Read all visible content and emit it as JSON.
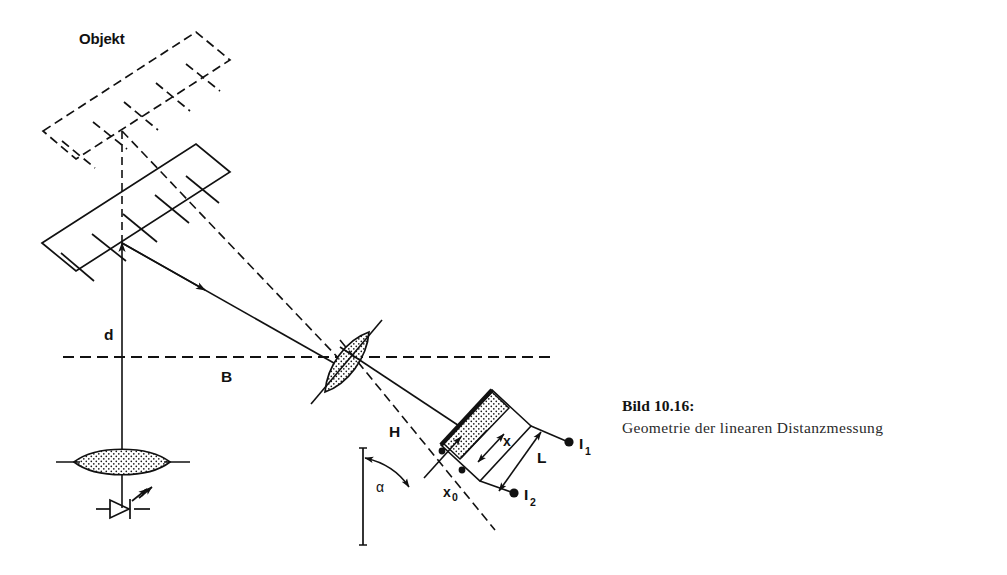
{
  "figure": {
    "caption_title": "Bild 10.16:",
    "caption_text": "Geometrie der linearen Distanzmessung",
    "background_color": "#ffffff",
    "ink_color": "#111111"
  },
  "labels": {
    "object": "Objekt",
    "distance_d": "d",
    "baseline_B": "B",
    "image_distance_H": "H",
    "angle_alpha": "α",
    "position_x": "x",
    "offset_x0_main": "x",
    "offset_x0_sub": "0",
    "detector_length_L": "L",
    "current_1_main": "I",
    "current_1_sub": "1",
    "current_2_main": "I",
    "current_2_sub": "2"
  },
  "elements": {
    "object_far": "dashed hatched parallelogram (object at far position)",
    "object_near": "solid hatched parallelogram (object at near position)",
    "emitter_lens": "stippled transmitter lens",
    "led_source": "light emitting diode symbol with emission arrows",
    "receiver_lens": "stippled tilted receiver lens",
    "psd_detector": "position sensitive detector strip with two cells",
    "optical_axis": "dashed horizontal baseline through both lenses",
    "ray_near": "solid ray from near object to receiver lens",
    "ray_far": "dashed ray from far object to receiver lens"
  }
}
